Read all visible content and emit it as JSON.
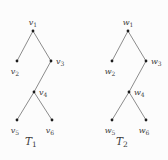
{
  "figure": {
    "background": "#fcfcfc",
    "node_color": "#1c1c1c",
    "edge_color": "#6e6e6e",
    "label_color": "#3c3c3c",
    "trees": [
      {
        "caption": {
          "letter": "T",
          "sub": "1",
          "x": 31,
          "y": 145
        },
        "nodes": [
          {
            "id": "v1",
            "letter": "v",
            "sub": "1",
            "x": 33,
            "y": 31,
            "label_pos": "above"
          },
          {
            "id": "v2",
            "letter": "v",
            "sub": "2",
            "x": 17,
            "y": 61,
            "label_pos": "below"
          },
          {
            "id": "v3",
            "letter": "v",
            "sub": "3",
            "x": 51,
            "y": 61,
            "label_pos": "right"
          },
          {
            "id": "v4",
            "letter": "v",
            "sub": "4",
            "x": 34,
            "y": 92,
            "label_pos": "right"
          },
          {
            "id": "v5",
            "letter": "v",
            "sub": "5",
            "x": 17,
            "y": 120,
            "label_pos": "below"
          },
          {
            "id": "v6",
            "letter": "v",
            "sub": "6",
            "x": 52,
            "y": 120,
            "label_pos": "below"
          }
        ],
        "edges": [
          [
            "v1",
            "v2"
          ],
          [
            "v1",
            "v3"
          ],
          [
            "v3",
            "v4"
          ],
          [
            "v4",
            "v5"
          ],
          [
            "v4",
            "v6"
          ]
        ]
      },
      {
        "caption": {
          "letter": "T",
          "sub": "2",
          "x": 122,
          "y": 145
        },
        "nodes": [
          {
            "id": "w1",
            "letter": "w",
            "sub": "1",
            "x": 128,
            "y": 31,
            "label_pos": "above"
          },
          {
            "id": "w2",
            "letter": "w",
            "sub": "2",
            "x": 112,
            "y": 61,
            "label_pos": "below"
          },
          {
            "id": "w3",
            "letter": "w",
            "sub": "3",
            "x": 146,
            "y": 61,
            "label_pos": "right"
          },
          {
            "id": "w4",
            "letter": "w",
            "sub": "4",
            "x": 129,
            "y": 92,
            "label_pos": "right"
          },
          {
            "id": "w5",
            "letter": "w",
            "sub": "5",
            "x": 112,
            "y": 120,
            "label_pos": "below"
          },
          {
            "id": "w6",
            "letter": "w",
            "sub": "6",
            "x": 146,
            "y": 120,
            "label_pos": "below"
          }
        ],
        "edges": [
          [
            "w1",
            "w2"
          ],
          [
            "w1",
            "w3"
          ],
          [
            "w3",
            "w4"
          ],
          [
            "w4",
            "w5"
          ],
          [
            "w4",
            "w6"
          ]
        ]
      }
    ]
  }
}
